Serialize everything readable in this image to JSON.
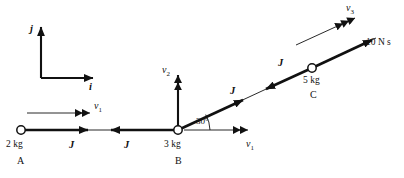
{
  "figure": {
    "stroke_color": "#111111",
    "background": "#ffffff"
  },
  "axes": {
    "vertical_label": "j",
    "horizontal_label": "i"
  },
  "bodies": [
    {
      "id": "A",
      "mass_label": "2 kg",
      "node_label": "A"
    },
    {
      "id": "B",
      "mass_label": "3 kg",
      "node_label": "B"
    },
    {
      "id": "C",
      "mass_label": "5 kg",
      "node_label": "C"
    }
  ],
  "impulse_labels": {
    "ab_left": "J",
    "ab_right": "J",
    "bc_lower": "J",
    "bc_upper": "J",
    "applied": "10 N s"
  },
  "velocity_labels": {
    "v1_left": "v",
    "v1_left_sub": "1",
    "v1_right": "v",
    "v1_right_sub": "1",
    "v2": "v",
    "v2_sub": "2",
    "v3": "v",
    "v3_sub": "3"
  },
  "angle": {
    "value": "30°"
  }
}
